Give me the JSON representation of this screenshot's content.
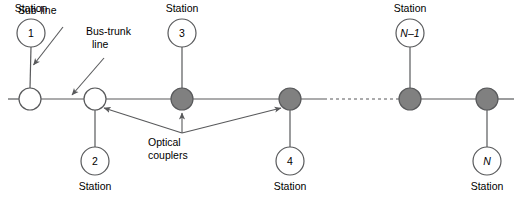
{
  "figure": {
    "type": "network-topology-diagram",
    "colors": {
      "line": "#58595b",
      "stroke": "#58595b",
      "coupler_fill": "#808080",
      "node_fill": "#ffffff",
      "text": "#000000",
      "background": "#ffffff"
    }
  },
  "annotations": {
    "sub_line": "Sub-line",
    "bus_trunk_line_1": "Bus-trunk",
    "bus_trunk_line_2": "line",
    "optical_couplers_1": "Optical",
    "optical_couplers_2": "couplers"
  },
  "station_word": "Station",
  "stations": [
    {
      "id": "station-1",
      "number": "1",
      "label": "Station",
      "label_position": "above",
      "cx": 31,
      "cy": 33,
      "label_y": 4
    },
    {
      "id": "station-2",
      "number": "2",
      "label": "Station",
      "label_position": "below",
      "cx": 95,
      "cy": 161,
      "label_y": 180
    },
    {
      "id": "station-3",
      "number": "3",
      "label": "Station",
      "label_position": "above",
      "cx": 182,
      "cy": 33,
      "label_y": 4
    },
    {
      "id": "station-4",
      "number": "4",
      "label": "Station",
      "label_position": "below",
      "cx": 290,
      "cy": 161,
      "label_y": 180
    },
    {
      "id": "station-n-minus-1",
      "number": "N–1",
      "italic": true,
      "label": "Station",
      "label_position": "above",
      "cx": 410,
      "cy": 33,
      "label_y": 4
    },
    {
      "id": "station-n",
      "number": "N",
      "italic": true,
      "label": "Station",
      "label_position": "below",
      "cx": 487,
      "cy": 161,
      "label_y": 180
    }
  ],
  "trunk_nodes": [
    {
      "id": "node-1",
      "kind": "plain",
      "cx": 30,
      "cy": 99,
      "r": 11
    },
    {
      "id": "node-2",
      "kind": "plain",
      "cx": 95,
      "cy": 99,
      "r": 11
    },
    {
      "id": "coupler-3",
      "kind": "coupler",
      "cx": 182,
      "cy": 99,
      "r": 11
    },
    {
      "id": "coupler-4",
      "kind": "coupler",
      "cx": 290,
      "cy": 99,
      "r": 11
    },
    {
      "id": "coupler-n-minus-1",
      "kind": "coupler",
      "cx": 410,
      "cy": 99,
      "r": 11
    },
    {
      "id": "coupler-n",
      "kind": "coupler",
      "cx": 487,
      "cy": 99,
      "r": 11
    }
  ],
  "trunk": {
    "left_end_x": 8,
    "right_end_x": 514,
    "y": 99,
    "dashed_from_x": 324,
    "dashed_to_x": 399
  }
}
